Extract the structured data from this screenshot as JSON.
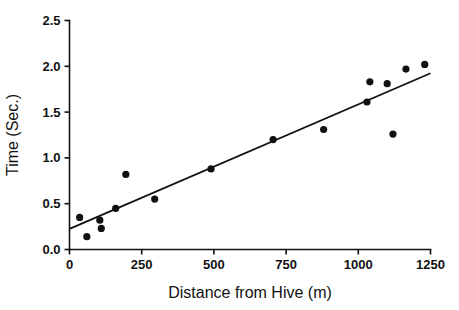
{
  "chart_data": {
    "type": "scatter",
    "title": "",
    "xlabel": "Distance from Hive (m)",
    "ylabel": "Time (Sec.)",
    "xlim": [
      0,
      1250
    ],
    "ylim": [
      0.0,
      2.5
    ],
    "xticks": [
      0,
      250,
      500,
      750,
      1000,
      1250
    ],
    "xtick_labels": [
      "0",
      "250",
      "500",
      "750",
      "1000",
      "1250"
    ],
    "yticks": [
      0.0,
      0.5,
      1.0,
      1.5,
      2.0,
      2.5
    ],
    "ytick_labels": [
      "0.0",
      "0.5",
      "1.0",
      "1.5",
      "2.0",
      "2.5"
    ],
    "grid": false,
    "legend": false,
    "marker": "filled-circle",
    "marker_color": "#111111",
    "series": [
      {
        "name": "Observations",
        "points": [
          [
            35,
            0.35
          ],
          [
            60,
            0.14
          ],
          [
            105,
            0.32
          ],
          [
            110,
            0.23
          ],
          [
            160,
            0.45
          ],
          [
            195,
            0.82
          ],
          [
            295,
            0.55
          ],
          [
            490,
            0.88
          ],
          [
            705,
            1.2
          ],
          [
            880,
            1.31
          ],
          [
            1030,
            1.61
          ],
          [
            1040,
            1.83
          ],
          [
            1100,
            1.81
          ],
          [
            1120,
            1.26
          ],
          [
            1165,
            1.97
          ],
          [
            1230,
            2.02
          ]
        ]
      }
    ],
    "trendline": {
      "name": "Linear fit",
      "x": [
        0,
        1250
      ],
      "y": [
        0.225,
        1.925
      ],
      "color": "#111111"
    }
  }
}
